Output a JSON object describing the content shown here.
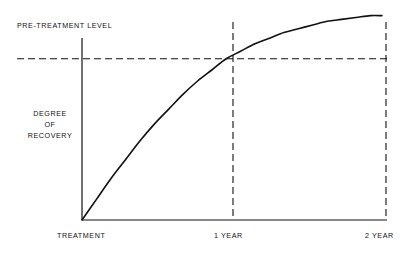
{
  "chart_data": {
    "type": "line",
    "title": "",
    "subtitle": "",
    "xlabel": "",
    "ylabel": "DEGREE OF RECOVERY",
    "xlim": [
      0,
      2.15
    ],
    "ylim": [
      0,
      1.12
    ],
    "grid": false,
    "legend_position": "none",
    "x_tick_labels": [
      "TREATMENT",
      "1 YEAR",
      "2 YEAR"
    ],
    "x_tick_values": [
      0,
      1,
      2
    ],
    "y_tick_labels": [],
    "series": [
      {
        "name": "Degree of recovery",
        "style": "solid",
        "color": "#111111",
        "x": [
          0.0,
          0.1,
          0.2,
          0.3,
          0.4,
          0.5,
          0.6,
          0.7,
          0.8,
          0.9,
          1.0,
          1.1,
          1.2,
          1.3,
          1.4,
          1.5,
          1.6,
          1.7,
          1.8,
          1.9,
          2.0,
          2.08
        ],
        "values": [
          0.0,
          0.11,
          0.22,
          0.32,
          0.42,
          0.51,
          0.59,
          0.67,
          0.74,
          0.8,
          0.86,
          0.9,
          0.94,
          0.97,
          1.0,
          1.02,
          1.04,
          1.06,
          1.07,
          1.08,
          1.09,
          1.09
        ]
      }
    ],
    "reference_lines": [
      {
        "name": "pre-treatment-level",
        "label": "PRE-TREATMENT LEVEL",
        "orientation": "horizontal",
        "value": 0.86,
        "style": "dashed",
        "color": "#111111"
      },
      {
        "name": "one-year-marker",
        "label": "1 YEAR",
        "orientation": "vertical",
        "value": 1.0,
        "style": "dashed",
        "color": "#111111"
      },
      {
        "name": "two-year-marker",
        "label": "2 YEAR",
        "orientation": "vertical",
        "value": 2.0,
        "style": "dashed",
        "color": "#111111"
      }
    ],
    "annotations": [
      {
        "text": "PRE-TREATMENT LEVEL",
        "position": "above-left-of-reference-line"
      },
      {
        "text": "DEGREE OF RECOVERY",
        "position": "left-of-y-axis"
      }
    ]
  },
  "labels": {
    "pretreatment_level": "PRE-TREATMENT LEVEL",
    "y_axis_line1": "DEGREE",
    "y_axis_line2": "OF",
    "y_axis_line3": "RECOVERY",
    "x_tick_0": "TREATMENT",
    "x_tick_1": "1 YEAR",
    "x_tick_2": "2 YEAR"
  },
  "colors": {
    "background": "#ffffff",
    "ink": "#111111",
    "axis": "#111111",
    "curve": "#111111",
    "dashed": "#111111"
  }
}
